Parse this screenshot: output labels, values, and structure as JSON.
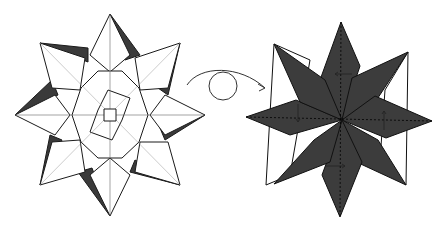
{
  "diagram": {
    "type": "origami-instruction",
    "steps": [
      {
        "name": "eight-point-star-front",
        "description": "Eight-pointed star with octagonal center and twist lock"
      },
      {
        "name": "eight-point-star-back",
        "description": "Model turned over, dark side with fold arrows"
      }
    ],
    "symbols": [
      "turn-over-arrow",
      "fold-arrows"
    ],
    "colors": {
      "dark": "#3a3a3a",
      "line": "#1a1a1a",
      "paper": "#ffffff"
    }
  }
}
